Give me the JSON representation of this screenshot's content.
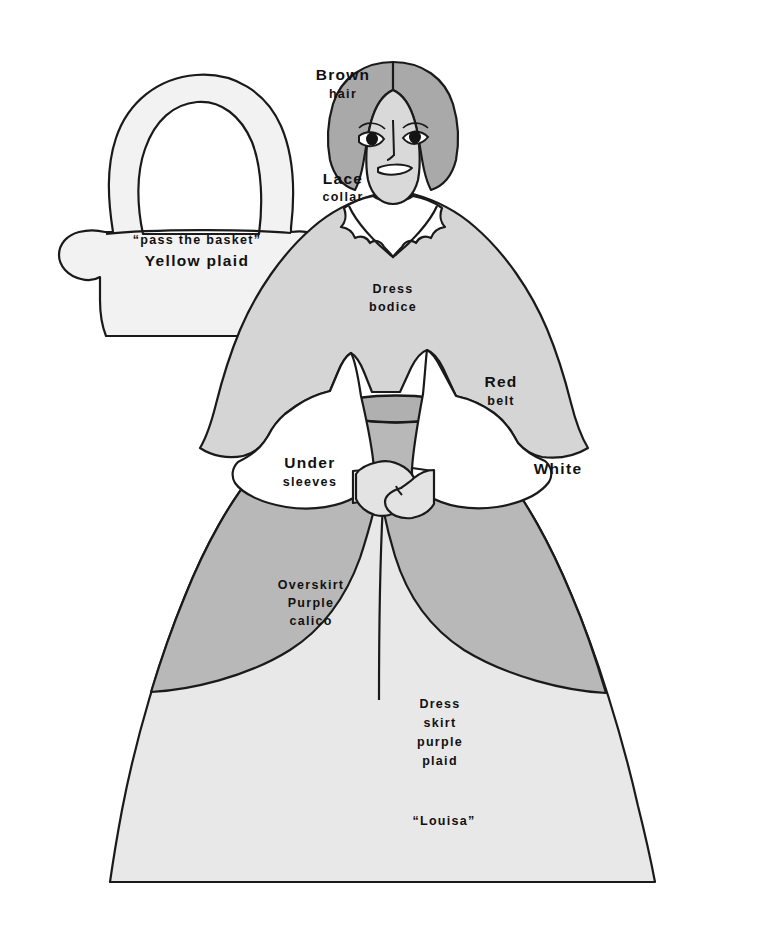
{
  "document": {
    "type": "paper-doll-pattern-illustration",
    "title": "Louisa paper doll dress pattern",
    "background_color": "#ffffff"
  },
  "palette": {
    "outline": "#1a1a1a",
    "white_piece": "#ffffff",
    "basket_fill": "#f2f2f2",
    "skirt_light": "#e8e8e8",
    "bodice_gray": "#d5d5d5",
    "overskirt_gray": "#b8b8b8",
    "belt_gray": "#b0b0b0",
    "hair_gray": "#a9a9a9",
    "face_gray": "#d9d9d9",
    "hand_gray": "#e3e3e3",
    "eye_dark": "#141414"
  },
  "labels": {
    "brown_hair": {
      "lines": [
        "Brown",
        "hair"
      ],
      "size": "small-caps-large"
    },
    "lace_collar": {
      "lines": [
        "Lace",
        "collar"
      ]
    },
    "basket": {
      "lines": [
        "“pass the basket”",
        "Yellow plaid"
      ]
    },
    "dress_bodice": {
      "lines": [
        "Dress",
        "bodice"
      ]
    },
    "red_belt": {
      "lines": [
        "Red",
        "belt"
      ]
    },
    "under_sleeves": {
      "lines": [
        "Under",
        "sleeves"
      ]
    },
    "white": {
      "lines": [
        "White"
      ]
    },
    "overskirt": {
      "lines": [
        "Overskirt",
        "Purple",
        "calico"
      ]
    },
    "dress_skirt": {
      "lines": [
        "Dress",
        "skirt",
        "purple",
        "plaid"
      ]
    },
    "doll_name": {
      "lines": [
        "“Louisa”"
      ]
    }
  },
  "parts": [
    {
      "name": "basket",
      "label_key": "brown_hair"
    },
    {
      "name": "hair"
    },
    {
      "name": "face"
    },
    {
      "name": "lace-collar"
    },
    {
      "name": "dress-bodice"
    },
    {
      "name": "red-belt"
    },
    {
      "name": "under-sleeves"
    },
    {
      "name": "hands"
    },
    {
      "name": "overskirt"
    },
    {
      "name": "dress-skirt"
    }
  ]
}
